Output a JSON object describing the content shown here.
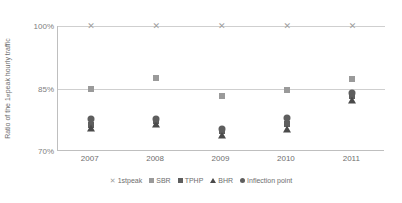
{
  "chart_data": {
    "type": "scatter",
    "title": "",
    "xlabel": "",
    "ylabel": "Ratio of the 1st peak hourly traffic",
    "categories": [
      "2007",
      "2008",
      "2009",
      "2010",
      "2011"
    ],
    "ytick_labels": [
      "100%",
      "85%",
      "70%"
    ],
    "ylim": [
      70,
      100
    ],
    "yticks": [
      70,
      85,
      100
    ],
    "grid": true,
    "legend_position": "bottom",
    "series": [
      {
        "name": "1stpeak",
        "marker": "cross",
        "color": "#a0a0a0",
        "values": [
          100,
          100,
          100,
          100,
          100
        ]
      },
      {
        "name": "SBR",
        "marker": "square-light",
        "color": "#9a9a9a",
        "values": [
          85.0,
          87.6,
          83.1,
          84.6,
          87.2
        ]
      },
      {
        "name": "TPHP",
        "marker": "square-dark",
        "color": "#5e5e5e",
        "values": [
          76.2,
          77.2,
          74.8,
          76.6,
          83.3
        ]
      },
      {
        "name": "BHR",
        "marker": "triangle",
        "color": "#4a4a4a",
        "values": [
          75.6,
          76.5,
          73.8,
          75.2,
          82.3
        ]
      },
      {
        "name": "Inflection point",
        "marker": "circle",
        "color": "#5e5e5e",
        "values": [
          77.6,
          77.6,
          75.4,
          78.0,
          84.0
        ]
      }
    ]
  },
  "legend": {
    "items": [
      {
        "label": "1stpeak",
        "glyph": "cross-icon"
      },
      {
        "label": "SBR",
        "glyph": "square-light-icon"
      },
      {
        "label": "TPHP",
        "glyph": "square-dark-icon"
      },
      {
        "label": "BHR",
        "glyph": "triangle-icon"
      },
      {
        "label": "Inflection point",
        "glyph": "circle-icon"
      }
    ]
  },
  "axis": {
    "y_label_prefix": "Ratio of the 1",
    "y_label_sup": "st",
    "y_label_suffix": " peak hourly traffic"
  },
  "cross_glyph": "✕"
}
